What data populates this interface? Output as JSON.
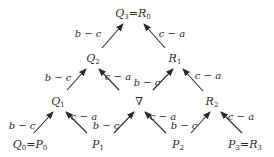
{
  "diagram": {
    "type": "triangular-network",
    "colors": {
      "ink": "#2a2a2a",
      "background": "#ffffff"
    },
    "nodes": [
      {
        "id": "Q3R0",
        "text": "Q",
        "sub": "3",
        "eq": "=",
        "text2": "R",
        "sub2": "0",
        "x": 133,
        "y": 14
      },
      {
        "id": "Q2",
        "text": "Q",
        "sub": "2",
        "x": 93,
        "y": 59
      },
      {
        "id": "R1",
        "text": "R",
        "sub": "1",
        "x": 175,
        "y": 59
      },
      {
        "id": "Q1",
        "text": "Q",
        "sub": "1",
        "x": 58,
        "y": 102
      },
      {
        "id": "nabla",
        "text": "∇",
        "x": 139,
        "y": 101
      },
      {
        "id": "R2",
        "text": "R",
        "sub": "2",
        "x": 212,
        "y": 102
      },
      {
        "id": "Q0P0",
        "text": "Q",
        "sub": "0",
        "eq": "=",
        "text2": "P",
        "sub2": "0",
        "x": 30,
        "y": 145
      },
      {
        "id": "P1",
        "text": "P",
        "sub": "1",
        "x": 98,
        "y": 145
      },
      {
        "id": "P2",
        "text": "P",
        "sub": "2",
        "x": 178,
        "y": 145
      },
      {
        "id": "P3R3",
        "text": "P",
        "sub": "3",
        "eq": "=",
        "text2": "R",
        "sub2": "3",
        "x": 245,
        "y": 145
      }
    ],
    "edges": [
      {
        "from": "Q2",
        "to": "Q3R0",
        "label": "b − c",
        "x1": 102,
        "y1": 48,
        "x2": 123,
        "y2": 24,
        "lx": 88,
        "ly": 34
      },
      {
        "from": "R1",
        "to": "Q3R0",
        "label": "c − a",
        "x1": 165,
        "y1": 48,
        "x2": 144,
        "y2": 24,
        "lx": 172,
        "ly": 34
      },
      {
        "from": "Q1",
        "to": "Q2",
        "label": "b − c",
        "x1": 67,
        "y1": 90,
        "x2": 86,
        "y2": 69,
        "lx": 58,
        "ly": 78
      },
      {
        "from": "nabla",
        "to": "Q2",
        "label": "c − a",
        "x1": 119,
        "y1": 90,
        "x2": 99,
        "y2": 69,
        "lx": 118,
        "ly": 77
      },
      {
        "from": "nabla",
        "to": "R1",
        "label": "b − c",
        "x1": 153,
        "y1": 90,
        "x2": 173,
        "y2": 69,
        "lx": 147,
        "ly": 83
      },
      {
        "from": "R2",
        "to": "R1",
        "label": "c − a",
        "x1": 203,
        "y1": 91,
        "x2": 183,
        "y2": 69,
        "lx": 208,
        "ly": 76
      },
      {
        "from": "Q0P0",
        "to": "Q1",
        "label": "b − c",
        "x1": 34,
        "y1": 133,
        "x2": 53,
        "y2": 112,
        "lx": 22,
        "ly": 126
      },
      {
        "from": "P1",
        "to": "Q1",
        "label": "c − a",
        "x1": 87,
        "y1": 133,
        "x2": 66,
        "y2": 112,
        "lx": 84,
        "ly": 117
      },
      {
        "from": "P1",
        "to": "nabla",
        "label": "b − c",
        "x1": 114,
        "y1": 133,
        "x2": 134,
        "y2": 112,
        "lx": 106,
        "ly": 126
      },
      {
        "from": "P2",
        "to": "nabla",
        "label": "c − a",
        "x1": 166,
        "y1": 133,
        "x2": 145,
        "y2": 112,
        "lx": 163,
        "ly": 117
      },
      {
        "from": "P2",
        "to": "R2",
        "label": "b − c",
        "x1": 191,
        "y1": 133,
        "x2": 210,
        "y2": 112,
        "lx": 184,
        "ly": 126
      },
      {
        "from": "P3R3",
        "to": "R2",
        "label": "c − a",
        "x1": 242,
        "y1": 133,
        "x2": 221,
        "y2": 112,
        "lx": 241,
        "ly": 117
      }
    ]
  }
}
